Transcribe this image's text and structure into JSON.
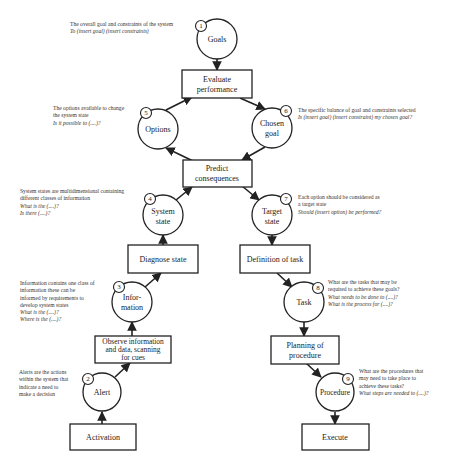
{
  "nodes": {
    "goals": {
      "number": "1",
      "label": "Goals"
    },
    "alert": {
      "number": "2",
      "label": "Alert"
    },
    "information": {
      "number": "3",
      "label_line1": "Infor-",
      "label_line2": "mation"
    },
    "system_state": {
      "number": "4",
      "label_line1": "System",
      "label_line2": "state"
    },
    "options": {
      "number": "5",
      "label": "Options"
    },
    "chosen_goal": {
      "number": "6",
      "label_line1": "Chosen",
      "label_line2": "goal"
    },
    "target_state": {
      "number": "7",
      "label_line1": "Target",
      "label_line2": "state"
    },
    "task": {
      "number": "8",
      "label": "Task"
    },
    "procedure": {
      "number": "9",
      "label": "Procedure"
    }
  },
  "boxes": {
    "evaluate_performance": {
      "line1": "Evaluate",
      "line2": "performance"
    },
    "predict_consequences": {
      "line1": "Predict",
      "line2": "consequences"
    },
    "diagnose_state": {
      "line1": "Diagnose state"
    },
    "definition_of_task": {
      "line1": "Definition of task"
    },
    "observe_information": {
      "line1": "Observe information",
      "line2": "and data, scanning",
      "line3": "for cues"
    },
    "planning_of_procedure": {
      "line1": "Planning of",
      "line2": "procedure"
    },
    "activation": {
      "line1": "Activation"
    },
    "execute": {
      "line1": "Execute"
    }
  },
  "annotations": {
    "goals": {
      "description": [
        "The overall goal and constraints of the system"
      ],
      "questions": [
        "To (insert goal) (insert constraints)"
      ]
    },
    "options": {
      "description": [
        "The options available to change",
        "the system state"
      ],
      "questions": [
        "Is it possible to (....)?"
      ]
    },
    "chosen_goal": {
      "description": [
        "The specific balance of goal and constraints selected"
      ],
      "questions": [
        "Is (insert goal) (insert constraint) my chosen goal?"
      ]
    },
    "system_state": {
      "description": [
        "System states are multidimensional containing",
        "different classes of information"
      ],
      "questions": [
        "What is the (....)?",
        "Is there (....)?"
      ]
    },
    "target_state": {
      "description": [
        "Each option should be considered as",
        "a target state"
      ],
      "questions": [
        "Should (insert option) be performed?"
      ]
    },
    "information": {
      "description": [
        "Information contains one class of",
        "information these can be",
        "informed by requirements to",
        "develop system states"
      ],
      "questions": [
        "What is the (....)?",
        "Where is the (....)?"
      ]
    },
    "task": {
      "description": [
        "What are the tasks that may be",
        "required to achieve these goals?"
      ],
      "questions": [
        "What needs to be done to (....)?",
        "What is the process for (....)?"
      ]
    },
    "alert": {
      "description": [
        "Alerts are the actions",
        "within the system that",
        "indicate a need to",
        "make a decision"
      ],
      "questions": []
    },
    "procedure": {
      "description": [
        "What are the procedures that",
        "may  need to take place to",
        "achieve these tasks?"
      ],
      "questions": [
        "What steps are needed to (....)?"
      ]
    }
  }
}
